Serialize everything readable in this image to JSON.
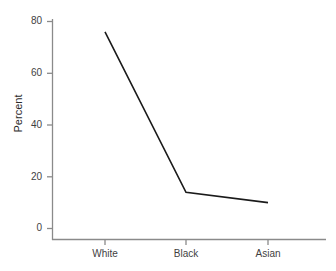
{
  "chart_data": {
    "type": "line",
    "title": "",
    "subtitle": "",
    "xlabel": "",
    "ylabel": "Percent",
    "categories": [
      "White",
      "Black",
      "Asian"
    ],
    "values": [
      76,
      14,
      10
    ],
    "series": [
      {
        "name": "Percent",
        "values": [
          76,
          14,
          10
        ],
        "color": "#1a1a1a"
      }
    ],
    "ylim": [
      0,
      80
    ],
    "yticks": [
      0,
      20,
      40,
      60,
      80
    ],
    "ytick_labels": [
      "0",
      "20",
      "40",
      "60",
      "80"
    ],
    "xticks": [
      "White",
      "Black",
      "Asian"
    ],
    "grid": false,
    "legend": false,
    "legend_position": "none",
    "axis_color": "#8a8a8a",
    "line_color": "#1a1a1a",
    "background": "#ffffff",
    "annotations": []
  },
  "axis": {
    "y_title": "Percent",
    "y_tick_0": "0",
    "y_tick_1": "20",
    "y_tick_2": "40",
    "y_tick_3": "60",
    "y_tick_4": "80",
    "x_tick_0": "White",
    "x_tick_1": "Black",
    "x_tick_2": "Asian"
  }
}
